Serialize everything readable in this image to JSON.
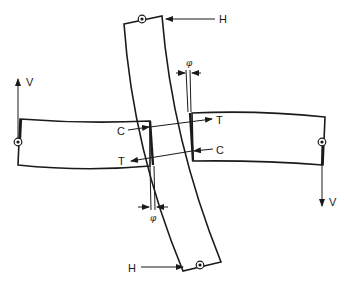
{
  "diagram": {
    "type": "structural free-body diagram",
    "stroke_color": "#1a1a1a",
    "background": "#ffffff",
    "members": [
      {
        "id": "vertical-member",
        "shape": "curved beam"
      },
      {
        "id": "left-member",
        "shape": "horizontal beam"
      },
      {
        "id": "right-member",
        "shape": "horizontal beam"
      }
    ],
    "labels": {
      "h_top": "H",
      "h_bottom": "H",
      "v_left": "V",
      "v_right": "V",
      "c_left": "C",
      "t_left": "T",
      "t_right": "T",
      "c_right": "C",
      "phi_top": "φ",
      "phi_bottom": "φ"
    },
    "icons": {
      "pin": "circled-dot",
      "arrow": "filled-arrowhead"
    }
  }
}
